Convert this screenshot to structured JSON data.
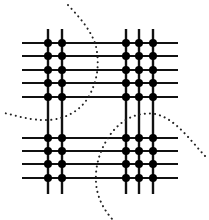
{
  "diagram": {
    "type": "grid-mesh-with-partition-cuts",
    "size": {
      "width": 209,
      "height": 220
    },
    "colors": {
      "background": "#ffffff",
      "line": "#111111",
      "node": "#000000",
      "cut": "#222222"
    },
    "horizontal_lines": {
      "x_start": 22,
      "x_end": 178,
      "top_group_y": [
        43,
        56,
        70,
        83,
        97
      ],
      "bottom_group_y": [
        138,
        151,
        164,
        178
      ]
    },
    "vertical_lines": {
      "y_start": 29,
      "y_end": 194,
      "left_group_x": [
        48,
        62
      ],
      "right_group_x": [
        126,
        139,
        153
      ]
    },
    "node_radius": 4,
    "cut_curves": [
      {
        "name": "upper-left-cut",
        "path": "M68,5 C82,20 95,35 97,52 C99,68 97,82 88,98 C80,110 68,118 50,120 C30,121 15,115 4,113"
      },
      {
        "name": "lower-right-cut",
        "path": "M205,156 C190,140 175,118 155,114 C135,111 118,122 108,138 C99,152 95,168 96,182 C97,198 104,210 113,220"
      }
    ]
  }
}
